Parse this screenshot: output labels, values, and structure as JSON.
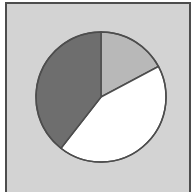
{
  "figure": {
    "title": "",
    "panel_background_color": "#d3d3d3",
    "frame_color": "#4d4d4d",
    "outer_background_color": "#ffffff",
    "frame_border_width_px": 2
  },
  "chart_data": {
    "type": "pie",
    "title": "",
    "subtitle": "",
    "xlabel": "",
    "ylabel": "",
    "grid": false,
    "legend_position": "none",
    "annotations": [],
    "start_angle_deg": 90,
    "direction": "clockwise",
    "center": {
      "cx": 101,
      "cy": 97
    },
    "radius": 65,
    "outline_color": "#4d4d4d",
    "outline_width": 1.5,
    "categories": [
      "Slice 1",
      "Slice 2",
      "Slice 3"
    ],
    "values": [
      17,
      43,
      40
    ],
    "percent_labels": [
      "17%",
      "43%",
      "40%"
    ],
    "colors": [
      "#b8b8b8",
      "#ffffff",
      "#6e6e6e"
    ],
    "slices": [
      {
        "name": "Slice 1",
        "value": 17,
        "percent": "17%",
        "color": "#b8b8b8",
        "start_angle_deg": 0,
        "end_angle_deg": 62
      },
      {
        "name": "Slice 2",
        "value": 43,
        "percent": "43%",
        "color": "#ffffff",
        "start_angle_deg": 62,
        "end_angle_deg": 218
      },
      {
        "name": "Slice 3",
        "value": 40,
        "percent": "40%",
        "color": "#6e6e6e",
        "start_angle_deg": 218,
        "end_angle_deg": 360
      }
    ]
  }
}
